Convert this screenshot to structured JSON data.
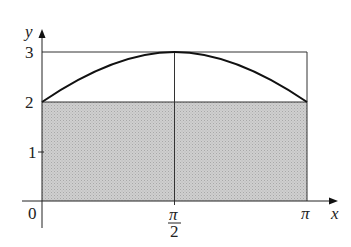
{
  "figure": {
    "axes": {
      "x_label": "x",
      "y_label": "y",
      "origin_label": "0",
      "x_ticks": [
        {
          "label_num": "π",
          "label_den": "2",
          "value": "π/2"
        },
        {
          "label": "π",
          "value": "π"
        }
      ],
      "y_ticks": [
        "1",
        "2",
        "3"
      ]
    },
    "curve": {
      "description": "y = 2 + sin x on [0, π]",
      "start": [
        0,
        2
      ],
      "peak": [
        "π/2",
        3
      ],
      "end": [
        "π",
        2
      ]
    },
    "shaded_region": {
      "description": "rectangle 0 ≤ x ≤ π, 0 ≤ y ≤ 2",
      "fill": "#c8c8c8"
    },
    "bounding_rectangle": {
      "description": "rectangle 0 ≤ x ≤ π, 0 ≤ y ≤ 3"
    }
  }
}
